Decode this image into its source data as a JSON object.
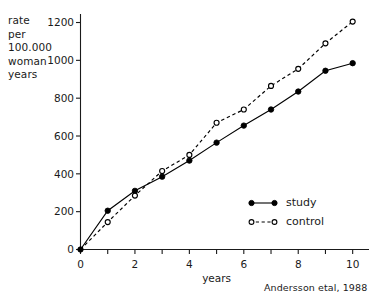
{
  "chart_data": {
    "type": "line",
    "title": "",
    "subtitle": "",
    "xlabel": "years",
    "ylabel": "rate per 100.000 woman years",
    "ylabel_lines": [
      "rate",
      "per",
      "100.000",
      "woman",
      "years"
    ],
    "x": [
      0,
      1,
      2,
      3,
      4,
      5,
      6,
      7,
      8,
      9,
      10
    ],
    "xlim": [
      0,
      10.6
    ],
    "ylim": [
      0,
      1245
    ],
    "xticks": [
      0,
      1,
      2,
      3,
      4,
      5,
      6,
      7,
      8,
      9,
      10
    ],
    "xtick_labels": [
      "0",
      "",
      "2",
      "",
      "4",
      "",
      "6",
      "",
      "8",
      "",
      "10"
    ],
    "yticks": [
      0,
      200,
      400,
      600,
      800,
      1000,
      1200
    ],
    "ytick_labels": [
      "0",
      "200",
      "400",
      "600",
      "800",
      "1000",
      "1200"
    ],
    "grid": false,
    "legend_position": "inside-right-lower",
    "series": [
      {
        "name": "study",
        "values": [
          0,
          205,
          310,
          385,
          470,
          565,
          655,
          740,
          835,
          945,
          985
        ],
        "line_style": "solid",
        "marker": "filled-circle",
        "color": "#000000"
      },
      {
        "name": "control",
        "values": [
          0,
          145,
          285,
          415,
          500,
          670,
          740,
          865,
          955,
          1090,
          1205
        ],
        "line_style": "dashed",
        "marker": "open-circle",
        "color": "#000000"
      }
    ],
    "annotations": [
      {
        "name": "source-caption",
        "text": "Andersson etal, 1988"
      }
    ]
  },
  "legend": {
    "items": [
      {
        "label": "study",
        "marker": "filled-circle",
        "line_style": "solid"
      },
      {
        "label": "control",
        "marker": "open-circle",
        "line_style": "dashed"
      }
    ]
  },
  "axes": {
    "x_title": "years",
    "y_title_lines": [
      "rate",
      "per",
      "100.000",
      "woman",
      "years"
    ]
  },
  "caption": {
    "source": "Andersson etal, 1988"
  },
  "colors": {
    "ink": "#1a1a1a",
    "line": "#000000",
    "background": "#ffffff"
  }
}
